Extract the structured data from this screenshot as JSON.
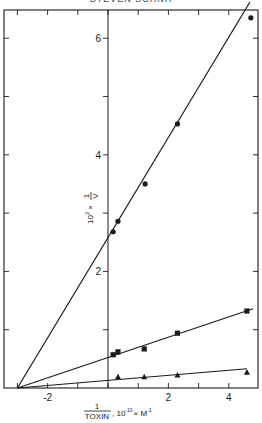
{
  "header": {
    "title": "STEVEN SCHNH"
  },
  "chart_data": {
    "type": "scatter",
    "title": "",
    "xlabel": "1/TOXIN , 10^-10 × M^-1",
    "ylabel": "10^2 × 1/V",
    "xlim": [
      -3.3,
      5.0
    ],
    "ylim": [
      0,
      6.6
    ],
    "x_ticks": [
      -3,
      -2,
      -1,
      0,
      1,
      2,
      3,
      4,
      5
    ],
    "x_tick_labels": [
      "",
      "-2",
      "",
      "",
      "",
      "2",
      "",
      "4",
      ""
    ],
    "y_ticks": [
      0,
      1,
      2,
      3,
      4,
      5,
      6
    ],
    "y_tick_labels": [
      "",
      "",
      "2",
      "",
      "4",
      "",
      "6"
    ],
    "grid": false,
    "legend": null,
    "series": [
      {
        "name": "circles",
        "marker": "circle",
        "x": [
          0.17,
          0.33,
          1.23,
          2.3,
          4.73
        ],
        "y": [
          2.68,
          2.86,
          3.5,
          4.53,
          6.35
        ],
        "fit_line": {
          "x": [
            -3.0,
            4.7
          ],
          "y": [
            0,
            6.62
          ]
        }
      },
      {
        "name": "squares",
        "marker": "square",
        "x": [
          0.17,
          0.33,
          1.2,
          2.3,
          4.6
        ],
        "y": [
          0.57,
          0.62,
          0.67,
          0.94,
          1.32
        ],
        "fit_line": {
          "x": [
            -3.0,
            4.8
          ],
          "y": [
            0,
            1.36
          ]
        }
      },
      {
        "name": "triangles",
        "marker": "triangle",
        "x": [
          0.33,
          1.2,
          2.3,
          4.6
        ],
        "y": [
          0.19,
          0.19,
          0.22,
          0.27
        ],
        "fit_line": {
          "x": [
            -3.0,
            4.6
          ],
          "y": [
            0,
            0.33
          ]
        }
      }
    ]
  },
  "axis": {
    "y_label_main": "10",
    "y_label_exp": "2",
    "y_label_times": "×",
    "y_label_num": "1",
    "y_label_den": "V",
    "x_label_num": "1",
    "x_label_den": "TOXIN",
    "x_label_rest": ", 10",
    "x_label_exp": "-10",
    "x_label_unit": "× M",
    "x_label_unit_exp": "-1"
  }
}
